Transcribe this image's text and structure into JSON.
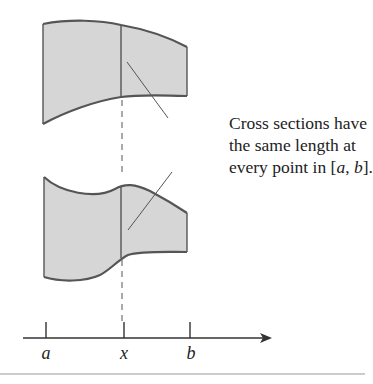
{
  "diagram": {
    "caption": {
      "line1": "Cross sections have",
      "line2": "the same length at",
      "line3_prefix": "every point in [",
      "a": "a",
      "comma": ", ",
      "b": "b",
      "line3_suffix": "]."
    },
    "axis": {
      "labels": [
        "a",
        "x",
        "b"
      ]
    },
    "colors": {
      "fill": "#d6d6d6",
      "stroke": "#555555",
      "rule": "#cccccc"
    }
  }
}
